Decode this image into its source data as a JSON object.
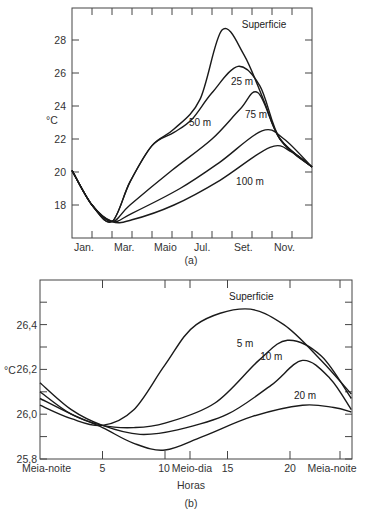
{
  "chart_data": [
    {
      "id": "a",
      "type": "line",
      "caption": "(a)",
      "title": "",
      "xlabel": "",
      "ylabel": "°C",
      "x_tick_labels": [
        "Jan.",
        "Mar.",
        "Maio",
        "Jul.",
        "Set.",
        "Nov."
      ],
      "x_months": [
        "Jan",
        "Fev",
        "Mar",
        "Abr",
        "Mai",
        "Jun",
        "Jul",
        "Ago",
        "Set",
        "Out",
        "Nov",
        "Dez"
      ],
      "y_ticks": [
        18,
        20,
        22,
        24,
        26,
        28
      ],
      "y_tick_labels": [
        "18",
        "20",
        "22",
        "24",
        "26",
        "28"
      ],
      "ylim": [
        16.2,
        29.9
      ],
      "xlim": [
        0,
        12
      ],
      "grid": false,
      "series": [
        {
          "name": "Superfície",
          "label": "Superficie",
          "x": [
            0,
            1,
            2,
            2.9,
            4,
            5.1,
            6.4,
            7.5,
            8.6,
            9.6,
            10.4,
            12
          ],
          "values": [
            20.1,
            18.0,
            17.0,
            19.4,
            21.6,
            22.6,
            24.4,
            28.6,
            27.1,
            24.3,
            22.0,
            20.3
          ]
        },
        {
          "name": "25 m",
          "label": "25 m",
          "x": [
            0,
            1,
            2,
            2.9,
            4,
            5.1,
            6.0,
            7.0,
            8.3,
            9.4,
            10.4,
            12
          ],
          "values": [
            20.1,
            18.0,
            17.0,
            19.4,
            21.6,
            22.4,
            23.2,
            24.8,
            26.4,
            25.2,
            22.0,
            20.3
          ]
        },
        {
          "name": "50 m",
          "label": "50 m",
          "x": [
            0,
            1,
            2,
            2.9,
            5.0,
            7.0,
            8.4,
            9.3,
            10.4,
            12
          ],
          "values": [
            20.1,
            18.0,
            17.0,
            18.0,
            20.1,
            22.0,
            23.8,
            24.8,
            22.0,
            20.3
          ]
        },
        {
          "name": "75 m",
          "label": "75 m",
          "x": [
            0,
            1,
            2,
            3,
            5.4,
            7.4,
            9.5,
            10.6,
            12
          ],
          "values": [
            20.1,
            18.0,
            17.0,
            17.5,
            19.0,
            20.6,
            22.5,
            22.0,
            20.3
          ]
        },
        {
          "name": "100 m",
          "label": "100 m",
          "x": [
            0,
            1,
            2,
            3,
            5.1,
            7.4,
            9.9,
            11.0,
            12
          ],
          "values": [
            20.1,
            18.0,
            17.0,
            17.1,
            18.0,
            19.5,
            21.5,
            21.2,
            20.3
          ]
        }
      ],
      "annotations": [
        {
          "text": "Superficie",
          "x": 9.6,
          "y": 28.7
        },
        {
          "text": "25 m",
          "x": 8.5,
          "y": 25.3
        },
        {
          "text": "50 m",
          "x": 6.4,
          "y": 22.8
        },
        {
          "text": "75 m",
          "x": 9.2,
          "y": 23.3
        },
        {
          "text": "100 m",
          "x": 8.9,
          "y": 19.2
        }
      ]
    },
    {
      "id": "b",
      "type": "line",
      "caption": "(b)",
      "title": "",
      "xlabel": "Horas",
      "ylabel": "°C",
      "x_tick_values": [
        0,
        5,
        10,
        12,
        15,
        20,
        24
      ],
      "x_tick_labels": [
        "Meia-noite",
        "5",
        "10",
        "Meio-dia",
        "15",
        "20",
        "Meia-noite"
      ],
      "y_ticks": [
        25.8,
        26.0,
        26.2,
        26.4
      ],
      "y_tick_labels": [
        "25,8",
        "26,0",
        "26,2",
        "26,4"
      ],
      "y_minor_ticks": [
        25.9,
        26.1,
        26.3,
        26.5
      ],
      "ylim": [
        25.8,
        26.58
      ],
      "xlim": [
        0,
        24.9
      ],
      "grid": false,
      "series": [
        {
          "name": "Superfície",
          "label": "Superficie",
          "x": [
            0,
            2.5,
            5,
            7.5,
            10,
            12.5,
            16.4,
            19.5,
            22.5,
            24.9
          ],
          "values": [
            26.04,
            25.98,
            25.95,
            26.02,
            26.22,
            26.4,
            26.47,
            26.4,
            26.24,
            26.09
          ]
        },
        {
          "name": "5 m",
          "label": "5 m",
          "x": [
            0,
            2.5,
            5,
            7.5,
            10,
            14,
            17.5,
            19.8,
            22.5,
            24.9
          ],
          "values": [
            26.1,
            26.0,
            25.95,
            25.94,
            25.96,
            26.05,
            26.24,
            26.33,
            26.26,
            26.07
          ]
        },
        {
          "name": "10 m",
          "label": "10 m",
          "x": [
            0,
            2.5,
            5,
            8,
            11,
            15,
            18.5,
            21,
            23.2,
            24.9
          ],
          "values": [
            26.14,
            26.02,
            25.95,
            25.91,
            25.93,
            26.0,
            26.13,
            26.24,
            26.16,
            26.02
          ]
        },
        {
          "name": "20 m",
          "label": "20 m",
          "x": [
            0,
            2.5,
            5,
            7.5,
            10,
            13,
            17,
            21,
            23.5,
            24.9
          ],
          "values": [
            26.07,
            26.0,
            25.94,
            25.87,
            25.84,
            25.9,
            25.99,
            26.04,
            26.03,
            26.01
          ]
        }
      ],
      "annotations": [
        {
          "text": "Superficie",
          "x": 16.9,
          "y": 26.51
        },
        {
          "text": "5 m",
          "x": 16.4,
          "y": 26.3
        },
        {
          "text": "10 m",
          "x": 18.5,
          "y": 26.24
        },
        {
          "text": "20 m",
          "x": 21.2,
          "y": 26.07
        }
      ]
    }
  ],
  "figure": {
    "chart_a": {
      "caption": "(a)",
      "ylabel": "°C"
    },
    "chart_b": {
      "caption": "(b)",
      "ylabel": "°C",
      "xlabel": "Horas"
    }
  }
}
